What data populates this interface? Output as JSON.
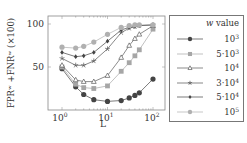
{
  "chart_data": {
    "type": "line",
    "title": "",
    "xlabel": "L",
    "ylabel": "FPR^w + FNR^w (×100)",
    "xscale": "log",
    "xlim": [
      0.7,
      130
    ],
    "ylim": [
      3,
      103
    ],
    "x_ticks": [
      "10^0",
      "10^1",
      "10^2"
    ],
    "y_ticks": [
      "50",
      "100"
    ],
    "x": [
      1,
      2,
      3,
      5,
      10,
      20,
      30,
      40,
      50,
      100
    ],
    "legend_title": "w value",
    "legend_position": "outside-right",
    "grid": false,
    "series": [
      {
        "name": "10^3",
        "marker": "circle",
        "color": "#444444",
        "values": [
          48,
          27,
          18,
          12,
          10,
          11,
          14,
          17,
          20,
          36
        ]
      },
      {
        "name": "5·10^3",
        "marker": "square",
        "color": "#a6a6a6",
        "values": [
          50,
          30,
          26,
          25,
          28,
          45,
          55,
          63,
          70,
          94
        ]
      },
      {
        "name": "10^4",
        "marker": "triangle",
        "color": "#5a5a5a",
        "values": [
          52,
          35,
          33,
          33,
          40,
          61,
          75,
          83,
          88,
          98
        ]
      },
      {
        "name": "3·10^4",
        "marker": "star",
        "color": "#555555",
        "values": [
          60,
          52,
          52,
          57,
          71,
          90,
          95,
          97,
          98,
          99
        ]
      },
      {
        "name": "5·10^4",
        "marker": "diamond",
        "color": "#444444",
        "values": [
          67,
          62,
          63,
          67,
          80,
          93,
          96,
          97,
          98,
          99
        ]
      },
      {
        "name": "10^5",
        "marker": "circle",
        "color": "#b0b0b0",
        "values": [
          73,
          72,
          74,
          79,
          88,
          96,
          98,
          99,
          99,
          99
        ]
      }
    ]
  },
  "labels": {
    "ylabel": "FPRʷ +FNRʷ (×100)",
    "xlabel": "L",
    "legend_title_var": "w",
    "legend_title_rest": " value",
    "yticks": [
      "100",
      "50"
    ],
    "xticks": [
      {
        "base": "10",
        "exp": "0"
      },
      {
        "base": "10",
        "exp": "1"
      },
      {
        "base": "10",
        "exp": "2"
      }
    ],
    "legend": [
      {
        "mant": "",
        "base": "10",
        "exp": "3"
      },
      {
        "mant": "5·",
        "base": "10",
        "exp": "3"
      },
      {
        "mant": "",
        "base": "10",
        "exp": "4"
      },
      {
        "mant": "3·",
        "base": "10",
        "exp": "4"
      },
      {
        "mant": "5·",
        "base": "10",
        "exp": "4"
      },
      {
        "mant": "",
        "base": "10",
        "exp": "5"
      }
    ]
  }
}
